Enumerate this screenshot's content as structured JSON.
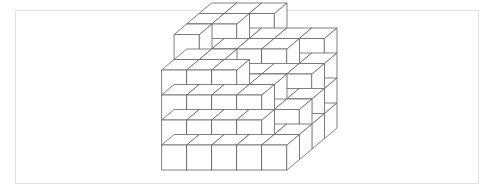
{
  "figure": {
    "frame": {
      "x": 15,
      "y": 10,
      "width": 464,
      "height": 174,
      "border_color": "#e2e2e2"
    },
    "style": {
      "stroke_color": "#6b6b6b",
      "stroke_width": 0.85,
      "top_face_color": "#ffffff",
      "left_face_color": "#ffffff",
      "right_face_color": "#fdfdfd",
      "background_color": "#ffffff"
    },
    "projection": {
      "origin_x": 162,
      "origin_y": 170,
      "cube_width": 25,
      "cube_height": 25,
      "depth_dx": 12.5,
      "depth_dy": -10.5,
      "grid_columns": 5,
      "grid_rows": 5,
      "grid_depth": 4
    },
    "heights_by_column_depth": [
      [
        4,
        5,
        5,
        5
      ],
      [
        4,
        4,
        5,
        5
      ],
      [
        4,
        3,
        4,
        5
      ],
      [
        3,
        3,
        4,
        4
      ],
      [
        1,
        2,
        3,
        4
      ]
    ],
    "cube_count": 77
  }
}
